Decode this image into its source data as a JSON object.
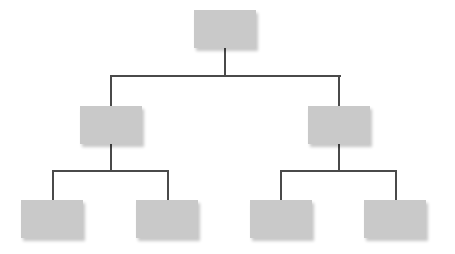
{
  "diagram": {
    "type": "tree",
    "colors": {
      "node_fill": "#c9c9c9",
      "connector": "#4a4a4a",
      "background": "#ffffff"
    },
    "nodes": [
      {
        "id": "root",
        "label": "",
        "level": 0,
        "x": 194,
        "y": 10
      },
      {
        "id": "mid-left",
        "label": "",
        "level": 1,
        "parent": "root",
        "x": 80,
        "y": 106
      },
      {
        "id": "mid-right",
        "label": "",
        "level": 1,
        "parent": "root",
        "x": 308,
        "y": 106
      },
      {
        "id": "leaf-1",
        "label": "",
        "level": 2,
        "parent": "mid-left",
        "x": 21,
        "y": 200
      },
      {
        "id": "leaf-2",
        "label": "",
        "level": 2,
        "parent": "mid-left",
        "x": 136,
        "y": 200
      },
      {
        "id": "leaf-3",
        "label": "",
        "level": 2,
        "parent": "mid-right",
        "x": 250,
        "y": 200
      },
      {
        "id": "leaf-4",
        "label": "",
        "level": 2,
        "parent": "mid-right",
        "x": 364,
        "y": 200
      }
    ]
  }
}
